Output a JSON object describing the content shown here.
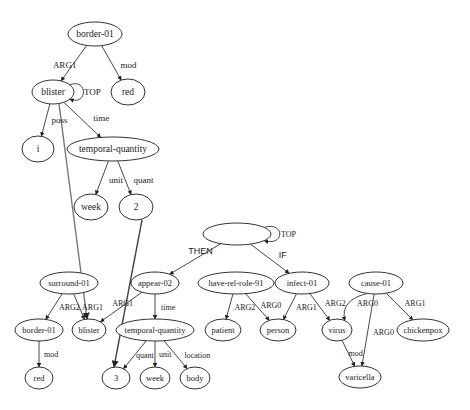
{
  "diagram": {
    "graphs": [
      {
        "id": "top",
        "nodes": [
          {
            "id": "t_border",
            "label": "border-01"
          },
          {
            "id": "t_red",
            "label": "red"
          },
          {
            "id": "t_blister",
            "label": "blister"
          },
          {
            "id": "t_i",
            "label": "i"
          },
          {
            "id": "t_tq",
            "label": "temporal-quantity"
          },
          {
            "id": "t_week",
            "label": "week"
          },
          {
            "id": "t_2",
            "label": "2"
          }
        ],
        "edges": [
          {
            "from": "t_border",
            "to": "t_blister",
            "label": "ARG1"
          },
          {
            "from": "t_border",
            "to": "t_red",
            "label": "mod"
          },
          {
            "from": "t_blister",
            "to": "t_blister",
            "label": "TOP"
          },
          {
            "from": "t_blister",
            "to": "t_i",
            "label": "poss"
          },
          {
            "from": "t_blister",
            "to": "t_tq",
            "label": "time"
          },
          {
            "from": "t_tq",
            "to": "t_week",
            "label": "unit"
          },
          {
            "from": "t_tq",
            "to": "t_2",
            "label": "quant"
          }
        ]
      },
      {
        "id": "bottom",
        "nodes": [
          {
            "id": "b_root",
            "label": ""
          },
          {
            "id": "b_surround",
            "label": "surround-01"
          },
          {
            "id": "b_appear",
            "label": "appear-02"
          },
          {
            "id": "b_hrr",
            "label": "have-rel-role-91"
          },
          {
            "id": "b_infect",
            "label": "infect-01"
          },
          {
            "id": "b_cause",
            "label": "cause-01"
          },
          {
            "id": "b_border",
            "label": "border-01"
          },
          {
            "id": "b_blister",
            "label": "blister"
          },
          {
            "id": "b_tq",
            "label": "temporal-quantity"
          },
          {
            "id": "b_patient",
            "label": "patient"
          },
          {
            "id": "b_person",
            "label": "person"
          },
          {
            "id": "b_virus",
            "label": "virus"
          },
          {
            "id": "b_chickenpox",
            "label": "chickenpox"
          },
          {
            "id": "b_red",
            "label": "red"
          },
          {
            "id": "b_3",
            "label": "3"
          },
          {
            "id": "b_week",
            "label": "week"
          },
          {
            "id": "b_body",
            "label": "body"
          },
          {
            "id": "b_varicella",
            "label": "varicella"
          }
        ],
        "edges": [
          {
            "from": "b_root",
            "to": "b_root",
            "label": "TOP"
          },
          {
            "from": "b_root",
            "to": "b_appear",
            "label": "THEN"
          },
          {
            "from": "b_root",
            "to": "b_infect",
            "label": "IF"
          },
          {
            "from": "b_surround",
            "to": "b_border",
            "label": "ARG2"
          },
          {
            "from": "b_surround",
            "to": "b_blister",
            "label": "ARG1"
          },
          {
            "from": "b_appear",
            "to": "b_blister",
            "label": "ARG1"
          },
          {
            "from": "b_appear",
            "to": "b_tq",
            "label": "time"
          },
          {
            "from": "b_hrr",
            "to": "b_patient",
            "label": "ARG2"
          },
          {
            "from": "b_hrr",
            "to": "b_person",
            "label": "ARG0"
          },
          {
            "from": "b_infect",
            "to": "b_person",
            "label": "ARG1"
          },
          {
            "from": "b_infect",
            "to": "b_virus",
            "label": "ARG2"
          },
          {
            "from": "b_cause",
            "to": "b_virus",
            "label": "ARG0"
          },
          {
            "from": "b_cause",
            "to": "b_varicella",
            "label": "ARG0"
          },
          {
            "from": "b_cause",
            "to": "b_chickenpox",
            "label": "ARG1"
          },
          {
            "from": "b_border",
            "to": "b_red",
            "label": "mod"
          },
          {
            "from": "b_tq",
            "to": "b_3",
            "label": "quant"
          },
          {
            "from": "b_tq",
            "to": "b_week",
            "label": "unit"
          },
          {
            "from": "b_tq",
            "to": "b_body",
            "label": "location"
          },
          {
            "from": "b_virus",
            "to": "b_varicella",
            "label": "mod"
          }
        ]
      }
    ],
    "alignments": [
      {
        "from": "t_blister",
        "to": "b_blister"
      },
      {
        "from": "t_2",
        "to": "b_3"
      }
    ]
  }
}
